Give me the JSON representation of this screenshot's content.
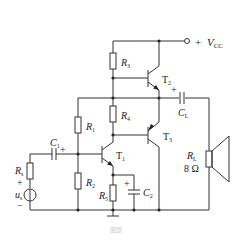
{
  "figure": {
    "type": "circuit-schematic",
    "caption": "图题"
  },
  "supply": {
    "label_sign": "+",
    "label_main": "V",
    "label_sub": "CC"
  },
  "components": {
    "R1": {
      "main": "R",
      "sub": "1"
    },
    "R2": {
      "main": "R",
      "sub": "2"
    },
    "R3": {
      "main": "R",
      "sub": "3"
    },
    "R4": {
      "main": "R",
      "sub": "4"
    },
    "R5": {
      "main": "R",
      "sub": "5"
    },
    "Rs": {
      "main": "R",
      "sub": "s"
    },
    "RL": {
      "main": "R",
      "sub": "L",
      "value": "8 Ω"
    },
    "C1": {
      "main": "C",
      "sub": "1",
      "polarity": "+"
    },
    "C2": {
      "main": "C",
      "sub": "2",
      "polarity": "+"
    },
    "CL": {
      "main": "C",
      "sub": "L",
      "polarity": "+"
    },
    "T1": {
      "main": "T",
      "sub": "1"
    },
    "T2": {
      "main": "T",
      "sub": "2"
    },
    "T3": {
      "main": "T",
      "sub": "3"
    },
    "source": {
      "main": "u",
      "sub": "s",
      "plus": "+",
      "minus": "−"
    }
  },
  "colors": {
    "wire": "#333333",
    "background": "#ffffff",
    "text": "#222222"
  }
}
